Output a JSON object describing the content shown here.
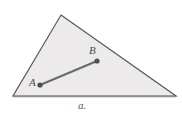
{
  "figure": {
    "caption": "a.",
    "background_color": "#ffffff",
    "shape": {
      "name": "triangle",
      "fill_color": "#eceaea",
      "stroke_color": "#5a5a5a",
      "stroke_width": 1.2,
      "vertices": [
        {
          "name": "apex",
          "x": 61,
          "y": 15
        },
        {
          "name": "bottom-right",
          "x": 176,
          "y": 96
        },
        {
          "name": "bottom-left",
          "x": 13,
          "y": 96
        }
      ]
    },
    "baseline": {
      "name": "base-shadow",
      "color": "#8d8d8d",
      "x1": 13,
      "y1": 96.5,
      "x2": 176,
      "y2": 96.5,
      "width": 1.6
    },
    "segment": {
      "name": "segment-AB",
      "color": "#6b6b6b",
      "width": 2.2,
      "endpoints": [
        {
          "label": "A",
          "x": 40,
          "y": 85
        },
        {
          "label": "B",
          "x": 97,
          "y": 61
        }
      ]
    },
    "points": [
      {
        "label": "A",
        "x": 40,
        "y": 85,
        "radius": 2.6,
        "color": "#4f4f4f",
        "label_x": 29,
        "label_y": 77
      },
      {
        "label": "B",
        "x": 97,
        "y": 61,
        "radius": 2.6,
        "color": "#4f4f4f",
        "label_x": 89,
        "label_y": 45
      }
    ]
  }
}
